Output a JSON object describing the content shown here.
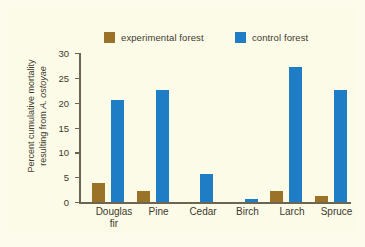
{
  "chart_data": {
    "type": "bar",
    "title": "",
    "xlabel": "",
    "ylabel": "Percent cumulative mortality resulting from A. ostoyae",
    "ylabel_line1": "Percent cumulative mortality",
    "ylabel_line2_prefix": "resulting from ",
    "ylabel_species": "A. ostoyae",
    "categories": [
      "Douglas\nfir",
      "Pine",
      "Cedar",
      "Birch",
      "Larch",
      "Spruce"
    ],
    "ylim": [
      0,
      30
    ],
    "yticks": [
      0,
      5,
      10,
      15,
      20,
      25,
      30
    ],
    "ytick_labels": [
      "0",
      "5",
      "10",
      "15",
      "20",
      "25",
      "30"
    ],
    "grid": false,
    "legend_position": "top",
    "series": [
      {
        "name": "experimental forest",
        "color": "#9a7328",
        "values": [
          3.8,
          2.3,
          0,
          0,
          2.3,
          1.2
        ]
      },
      {
        "name": "control forest",
        "color": "#1e7dc4",
        "values": [
          20.6,
          22.5,
          5.6,
          0.6,
          27.2,
          22.6
        ]
      }
    ]
  },
  "colors": {
    "experimental": "#9a7328",
    "control": "#1e7dc4",
    "background": "#fcfbe8",
    "axis": "#6b6552",
    "text": "#403a2c"
  }
}
